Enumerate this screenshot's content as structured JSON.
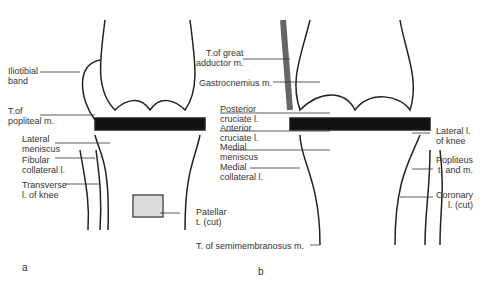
{
  "panels": {
    "a": "a",
    "b": "b"
  },
  "labels_a": {
    "iliotibial": "Iliotibial\nband",
    "popliteal": "T.of\npopliteal m.",
    "lateral_meniscus": "Lateral\nmeniscus",
    "fibular": "Fibular\ncollateral l.",
    "transverse": "Transverse\nl. of knee",
    "patellar": "Patellar\nt. (cut)"
  },
  "labels_center": {
    "great_adductor": "T.of great\nadductor m.",
    "gastrocnemius": "Gastrocnemius m.",
    "posterior_cruciate": "Posterior\ncruciate l.",
    "anterior_cruciate": "Anterior\ncruciate l.",
    "medial_meniscus": "Medial\nmeniscus",
    "medial_collateral": "Medial\ncollateral l.",
    "semimembranosus": "T. of semimembranosus m."
  },
  "labels_b": {
    "lateral_knee": "Lateral l.\nof knee",
    "popliteus": "Popliteus\nt. and m.",
    "coronary": "Coronary\nl. (cut)"
  }
}
